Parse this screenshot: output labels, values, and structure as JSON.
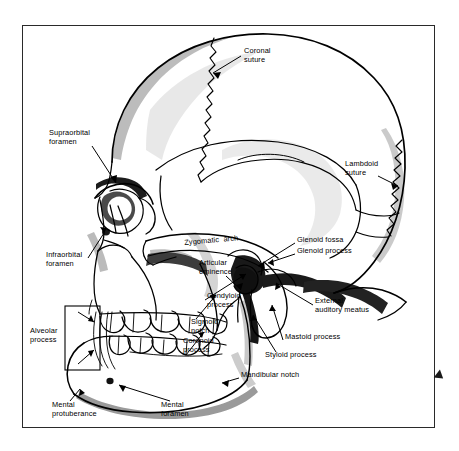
{
  "figure": {
    "frame": {
      "visible": true,
      "border_color": "#2a2a2a"
    },
    "colors": {
      "outline": "#000000",
      "fill": "#ffffff",
      "light_shade": "#c9c9c9",
      "mid_shade": "#8f8f8f",
      "dark_shade": "#3a3a3a",
      "very_dark": "#141414",
      "background": "#ffffff"
    },
    "edge_marker": {
      "name": "right-edge-arrow-marker",
      "color": "#1a1a1a"
    }
  },
  "labels": [
    {
      "id": "coronal-suture",
      "text": "Coronal\nsuture",
      "x": 244,
      "y": 51,
      "align": "left"
    },
    {
      "id": "supraorbital-foramen",
      "text": "Supraorbital\nforamen",
      "x": 49,
      "y": 133,
      "align": "left"
    },
    {
      "id": "lambdoid-suture",
      "text": "Lambdoid\nsuture",
      "x": 345,
      "y": 164,
      "align": "left"
    },
    {
      "id": "zygomatic-arch",
      "text": "Zygomatic  arch",
      "x": 184,
      "y": 243,
      "align": "left"
    },
    {
      "id": "glenoid-fossa",
      "text": "Glenoid fossa",
      "x": 297,
      "y": 240,
      "align": "left"
    },
    {
      "id": "glenoid-process",
      "text": "Glenoid process",
      "x": 297,
      "y": 251,
      "align": "left"
    },
    {
      "id": "infraorbital-foramen",
      "text": "Infraorbital\nforamen",
      "x": 46,
      "y": 255,
      "align": "left"
    },
    {
      "id": "articular-eminence",
      "text": "Articular\neminence",
      "x": 199,
      "y": 263,
      "align": "left"
    },
    {
      "id": "condyloid-process",
      "text": "Condyloid\nprocess",
      "x": 207,
      "y": 296,
      "align": "left"
    },
    {
      "id": "external-auditory-meatus",
      "text": "External\nauditory meatus",
      "x": 315,
      "y": 301,
      "align": "left"
    },
    {
      "id": "sigmoid-notch",
      "text": "Sigmoid\nnotch",
      "x": 191,
      "y": 322,
      "align": "left"
    },
    {
      "id": "alveolar-process",
      "text": "Alveolar\nprocess",
      "x": 30,
      "y": 331,
      "align": "left"
    },
    {
      "id": "mastoid-process",
      "text": "Mastoid process",
      "x": 285,
      "y": 337,
      "align": "left"
    },
    {
      "id": "coronoid-process",
      "text": "Coronoid\nprocess",
      "x": 183,
      "y": 341,
      "align": "left"
    },
    {
      "id": "styloid-process",
      "text": "Styloid process",
      "x": 265,
      "y": 355,
      "align": "left"
    },
    {
      "id": "mandibular-notch",
      "text": "Mandibular notch",
      "x": 241,
      "y": 375,
      "align": "left"
    },
    {
      "id": "mental-foramen",
      "text": "Mental\nforamen",
      "x": 161,
      "y": 405,
      "align": "left"
    },
    {
      "id": "mental-protuberance",
      "text": "Mental\nprotuberance",
      "x": 52,
      "y": 405,
      "align": "left"
    }
  ],
  "structures": [
    {
      "id": "cranium",
      "name": "cranial-vault"
    },
    {
      "id": "frontal-bone",
      "name": "frontal-bone"
    },
    {
      "id": "parietal-bone",
      "name": "parietal-bone"
    },
    {
      "id": "temporal-bone",
      "name": "temporal-bone"
    },
    {
      "id": "occipital-bone",
      "name": "occipital-bone"
    },
    {
      "id": "orbit",
      "name": "orbital-cavity"
    },
    {
      "id": "nasal-aperture",
      "name": "nasal-aperture"
    },
    {
      "id": "maxilla",
      "name": "maxilla"
    },
    {
      "id": "mandible",
      "name": "mandible"
    },
    {
      "id": "upper-teeth",
      "name": "upper-dental-arch"
    },
    {
      "id": "lower-teeth",
      "name": "lower-dental-arch"
    },
    {
      "id": "coronal-suture-line",
      "name": "coronal-suture-line"
    },
    {
      "id": "lambdoid-suture-line",
      "name": "lambdoid-suture-line"
    },
    {
      "id": "squamous-suture-line",
      "name": "squamous-suture-line"
    },
    {
      "id": "alveolar-bracket",
      "name": "alveolar-process-bracket-box"
    }
  ]
}
